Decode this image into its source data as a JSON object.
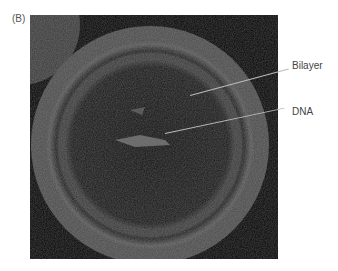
{
  "figure": {
    "panel_label": "(B)",
    "callouts": [
      {
        "label": "Bilayer"
      },
      {
        "label": "DNA"
      }
    ]
  }
}
